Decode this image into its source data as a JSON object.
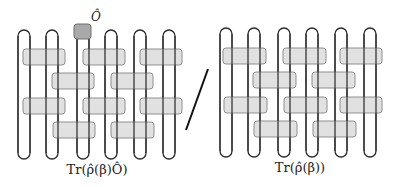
{
  "diagram": {
    "left": {
      "caption": "Tr(ρ̂(β)Ô)",
      "operator_label": "Ô",
      "operator_color": "#a9a9a9",
      "gate_color": "#dcdcdc",
      "num_sites": 6,
      "gate_rows": 4
    },
    "divider": "/",
    "right": {
      "caption": "Tr(ρ̂(β))",
      "gate_color": "#dcdcdc",
      "num_sites": 6,
      "gate_rows": 4
    }
  }
}
